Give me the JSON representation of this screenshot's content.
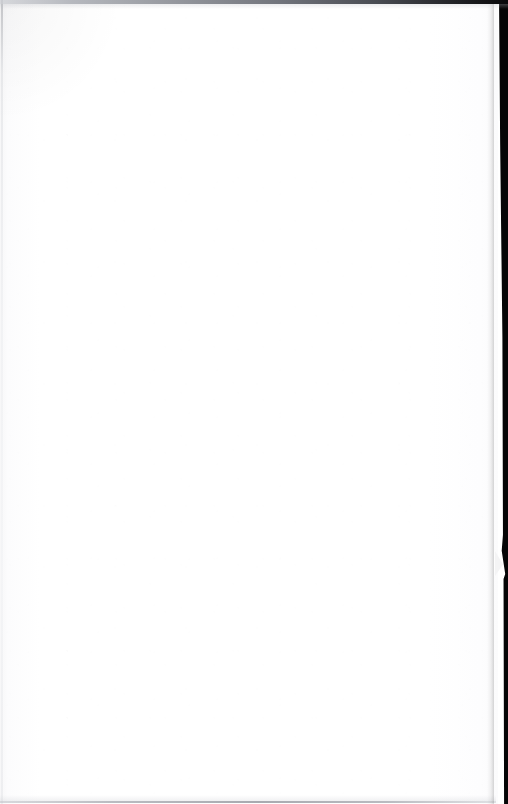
{
  "document": {
    "title": "Blank Scanned Page",
    "page_state": "blank",
    "body_text": "",
    "visible_text_count": "0"
  },
  "canvas": {
    "width": "508",
    "height": "804",
    "background_color": "#ffffff"
  },
  "page": {
    "name": "scanned-sheet",
    "paper_color": "#ffffff",
    "paper_shade_color": "#f7f7f8",
    "content": ""
  },
  "edges": {
    "top": {
      "name": "top-scan-edge",
      "color_light": "#cdcfd4",
      "color_dark": "#08080a"
    },
    "left": {
      "name": "left-scan-edge",
      "color": "#96989e"
    },
    "bottom": {
      "name": "bottom-scan-edge",
      "color": "#92959c"
    }
  },
  "void": {
    "name": "right-void-band",
    "color": "#050506",
    "notch": {
      "name": "void-notch",
      "color": "#f4f4f5"
    }
  },
  "icons": {
    "page_icon": "blank-page-icon"
  }
}
